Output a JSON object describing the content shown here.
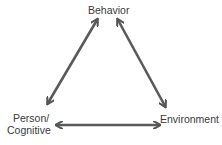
{
  "diagram": {
    "type": "triangle-reciprocal-arrows",
    "nodes": {
      "top": "Behavior",
      "left_line1": "Person/",
      "left_line2": "Cognitive",
      "right": "Environment"
    },
    "edges": [
      {
        "from": "Person/Cognitive",
        "to": "Behavior",
        "bidirectional": true
      },
      {
        "from": "Behavior",
        "to": "Environment",
        "bidirectional": true
      },
      {
        "from": "Person/Cognitive",
        "to": "Environment",
        "bidirectional": true
      }
    ],
    "arrow_color": "#5a5a5a",
    "text_color": "#3a3a3a"
  }
}
